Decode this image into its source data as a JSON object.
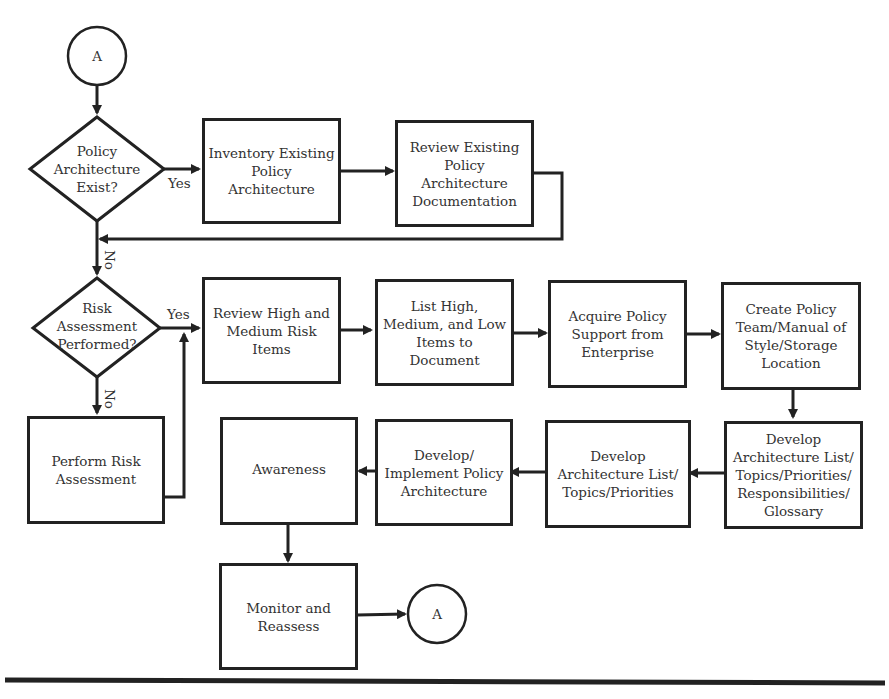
{
  "diagram": {
    "type": "flowchart",
    "connectors": {
      "top": {
        "label": "A"
      },
      "bottom": {
        "label": "A"
      }
    },
    "decisions": [
      {
        "id": "d1",
        "text": "Policy\nArchitecture\nExist?",
        "yes_label": "Yes",
        "no_label": "No"
      },
      {
        "id": "d2",
        "text": "Risk\nAssessment\nPerformed?",
        "yes_label": "Yes",
        "no_label": "No"
      }
    ],
    "processes": [
      {
        "id": "p1",
        "text": "Inventory Existing\nPolicy\nArchitecture"
      },
      {
        "id": "p2",
        "text": "Review Existing\nPolicy\nArchitecture\nDocumentation"
      },
      {
        "id": "p3",
        "text": "Review High and\nMedium Risk\nItems"
      },
      {
        "id": "p4",
        "text": "List High,\nMedium, and Low\nItems to\nDocument"
      },
      {
        "id": "p5",
        "text": "Acquire Policy\nSupport from\nEnterprise"
      },
      {
        "id": "p6",
        "text": "Create Policy\nTeam/Manual of\nStyle/Storage\nLocation"
      },
      {
        "id": "p7",
        "text": "Develop\nArchitecture List/\nTopics/Priorities/\nResponsibilities/\nGlossary"
      },
      {
        "id": "p8",
        "text": "Develop\nArchitecture List/\nTopics/Priorities"
      },
      {
        "id": "p9",
        "text": "Develop/\nImplement Policy\nArchitecture"
      },
      {
        "id": "p10",
        "text": "Awareness"
      },
      {
        "id": "p11",
        "text": "Perform Risk\nAssessment"
      },
      {
        "id": "p12",
        "text": "Monitor and\nReassess"
      }
    ],
    "edges": [
      [
        "A",
        "d1"
      ],
      [
        "d1",
        "p1",
        "Yes"
      ],
      [
        "p1",
        "p2"
      ],
      [
        "p2",
        "d2"
      ],
      [
        "d1",
        "d2",
        "No"
      ],
      [
        "d2",
        "p3",
        "Yes"
      ],
      [
        "d2",
        "p11",
        "No"
      ],
      [
        "p11",
        "p3"
      ],
      [
        "p3",
        "p4"
      ],
      [
        "p4",
        "p5"
      ],
      [
        "p5",
        "p6"
      ],
      [
        "p6",
        "p7"
      ],
      [
        "p7",
        "p8"
      ],
      [
        "p8",
        "p9"
      ],
      [
        "p9",
        "p10"
      ],
      [
        "p10",
        "p12"
      ],
      [
        "p12",
        "A"
      ]
    ],
    "colors": {
      "stroke": "#222222",
      "text": "#333333",
      "background": "#ffffff"
    }
  }
}
